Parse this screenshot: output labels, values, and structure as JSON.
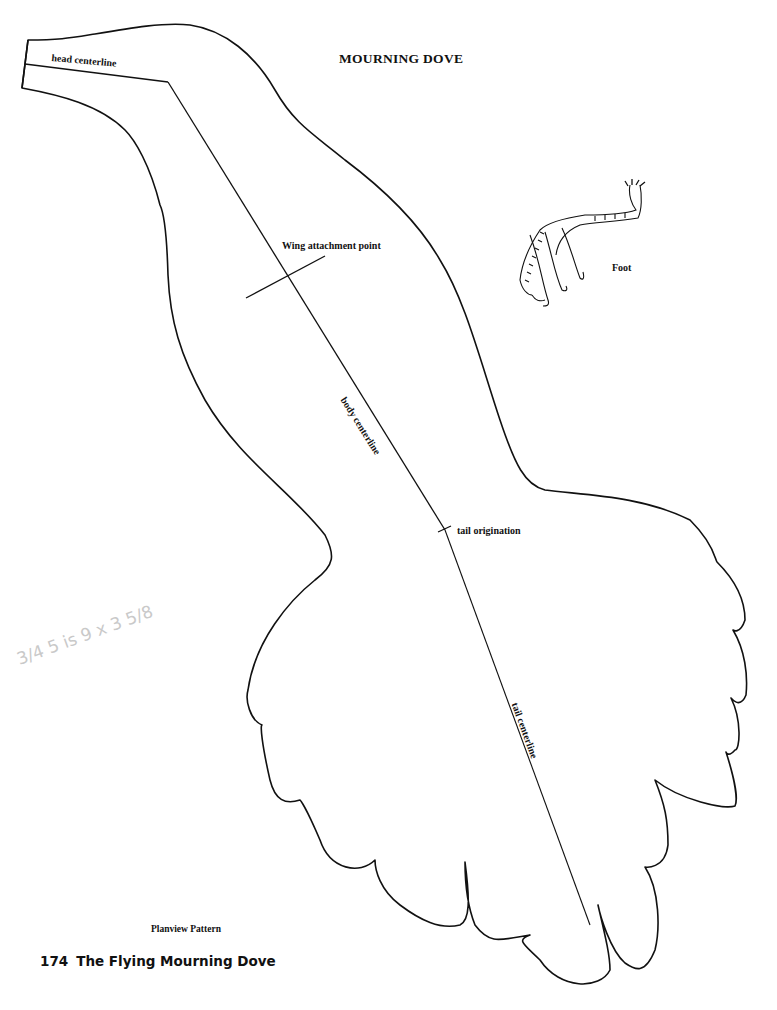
{
  "page": {
    "title": "MOURNING DOVE",
    "caption": "Planview Pattern",
    "footer": {
      "page_number": "174",
      "book_title": "The Flying Mourning Dove"
    }
  },
  "pattern": {
    "labels": {
      "head_centerline": "head centerline",
      "wing_attachment_point": "Wing attachment point",
      "body_centerline": "body centerline",
      "tail_origination": "tail origination",
      "tail_centerline": "tail centerline",
      "foot": "Foot"
    },
    "line_color": "#111111"
  },
  "annotations": {
    "pencil_note": "3/4 5 is 9 x 3 5/8"
  }
}
